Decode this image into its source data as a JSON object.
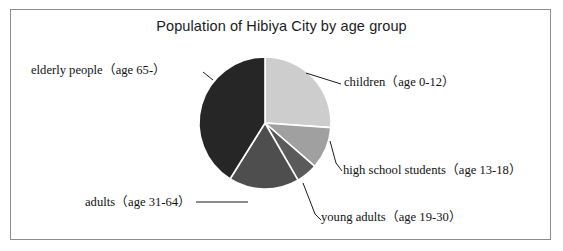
{
  "figure": {
    "title": "Population of Hibiya City by age group",
    "border_color": "#8d8d8d",
    "background": "#ffffff"
  },
  "chart_data": {
    "type": "pie",
    "title": "Population of Hibiya City by age group",
    "xlabel": "",
    "ylabel": "",
    "legend_position": "none",
    "grid": false,
    "start_angle_deg": 0,
    "direction": "clockwise",
    "categories": [
      "children（age 0-12）",
      "high school students（age 13-18）",
      "young adults（age 19-30）",
      "adults（age 31-64）",
      "elderly people（age 65-）"
    ],
    "values": [
      26,
      10,
      5,
      17,
      42
    ],
    "unit": "percent",
    "slices": [
      {
        "label": "children（age 0-12）",
        "short_name": "children",
        "age_range": "age 0-12",
        "value": 26,
        "start_deg": 0,
        "end_deg": 94,
        "color": "#cdcdcd",
        "label_side": "right"
      },
      {
        "label": "high school students（age 13-18）",
        "short_name": "high school students",
        "age_range": "age 13-18",
        "value": 10,
        "start_deg": 94,
        "end_deg": 131,
        "color": "#a0a0a0",
        "label_side": "right"
      },
      {
        "label": "young adults（age 19-30）",
        "short_name": "young adults",
        "age_range": "age 19-30",
        "value": 5,
        "start_deg": 131,
        "end_deg": 150,
        "color": "#5a5a5a",
        "label_side": "bottom-right"
      },
      {
        "label": "adults（age 31-64）",
        "short_name": "adults",
        "age_range": "age 31-64",
        "value": 17,
        "start_deg": 150,
        "end_deg": 212,
        "color": "#4e4e4e",
        "label_side": "bottom-left"
      },
      {
        "label": "elderly people（age 65-）",
        "short_name": "elderly people",
        "age_range": "age 65-",
        "value": 42,
        "start_deg": 212,
        "end_deg": 360,
        "color": "#262626",
        "label_side": "left"
      }
    ],
    "geometry": {
      "center_x": 265,
      "center_y": 123,
      "radius": 66,
      "separator_color": "#ffffff",
      "separator_width": 1.6
    }
  },
  "labels": {
    "children": "children（age 0-12）",
    "high_school_students": "high school students（age 13-18）",
    "young_adults": "young adults（age 19-30）",
    "adults": "adults（age 31-64）",
    "elderly_people": "elderly people（age 65-）"
  }
}
